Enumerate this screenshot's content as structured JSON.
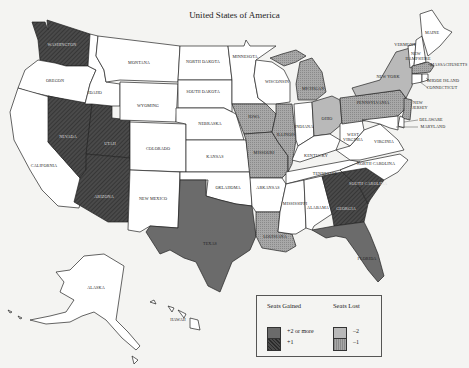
{
  "map": {
    "subtitle": "United States of America",
    "colors": {
      "gain2": "#6b6b6b",
      "gain1": "#3e3e3e",
      "lost2": "#b9b9b9",
      "lost1": "#9c9c9c",
      "none": "#ffffff",
      "border": "#222222"
    },
    "states": [
      {
        "name": "WASHINGTON",
        "category": "+1"
      },
      {
        "name": "OREGON",
        "category": "none"
      },
      {
        "name": "CALIFORNIA",
        "category": "none"
      },
      {
        "name": "NEVADA",
        "category": "+1"
      },
      {
        "name": "UTAH",
        "category": "+1"
      },
      {
        "name": "ARIZONA",
        "category": "+1"
      },
      {
        "name": "IDAHO",
        "category": "none"
      },
      {
        "name": "MONTANA",
        "category": "none"
      },
      {
        "name": "WYOMING",
        "category": "none"
      },
      {
        "name": "COLORADO",
        "category": "none"
      },
      {
        "name": "NEW MEXICO",
        "category": "none"
      },
      {
        "name": "NORTH DAKOTA",
        "category": "none"
      },
      {
        "name": "SOUTH DAKOTA",
        "category": "none"
      },
      {
        "name": "NEBRASKA",
        "category": "none"
      },
      {
        "name": "KANSAS",
        "category": "none"
      },
      {
        "name": "OKLAHOMA",
        "category": "none"
      },
      {
        "name": "TEXAS",
        "category": "+2 or more"
      },
      {
        "name": "MINNESOTA",
        "category": "none"
      },
      {
        "name": "IOWA",
        "category": "-1"
      },
      {
        "name": "MISSOURI",
        "category": "-1"
      },
      {
        "name": "ARKANSAS",
        "category": "none"
      },
      {
        "name": "LOUISIANA",
        "category": "-1"
      },
      {
        "name": "WISCONSIN",
        "category": "none"
      },
      {
        "name": "ILLINOIS",
        "category": "-1"
      },
      {
        "name": "MICHIGAN",
        "category": "-1"
      },
      {
        "name": "INDIANA",
        "category": "none"
      },
      {
        "name": "OHIO",
        "category": "-2"
      },
      {
        "name": "KENTUCKY",
        "category": "none"
      },
      {
        "name": "TENNESSEE",
        "category": "none"
      },
      {
        "name": "MISSISSIPPI",
        "category": "none"
      },
      {
        "name": "ALABAMA",
        "category": "none"
      },
      {
        "name": "GEORGIA",
        "category": "+1"
      },
      {
        "name": "FLORIDA",
        "category": "+2 or more"
      },
      {
        "name": "SOUTH CAROLINA",
        "category": "+1"
      },
      {
        "name": "NORTH CAROLINA",
        "category": "none"
      },
      {
        "name": "VIRGINIA",
        "category": "none"
      },
      {
        "name": "WEST VIRGINIA",
        "category": "none"
      },
      {
        "name": "PENNSYLVANIA",
        "category": "-1"
      },
      {
        "name": "NEW YORK",
        "category": "-2"
      },
      {
        "name": "NEW JERSEY",
        "category": "-1"
      },
      {
        "name": "DELAWARE",
        "category": "none"
      },
      {
        "name": "MARYLAND",
        "category": "none"
      },
      {
        "name": "VERMONT",
        "category": "none"
      },
      {
        "name": "NEW HAMPSHIRE",
        "category": "none"
      },
      {
        "name": "MAINE",
        "category": "none"
      },
      {
        "name": "MASSACHUSETTS",
        "category": "-1"
      },
      {
        "name": "RHODE ISLAND",
        "category": "none"
      },
      {
        "name": "CONNECTICUT",
        "category": "none"
      },
      {
        "name": "ALASKA",
        "category": "none"
      },
      {
        "name": "HAWAII",
        "category": "none"
      }
    ],
    "labels": {
      "wa": "WASHINGTON",
      "or": "OREGON",
      "ca": "CALIFORNIA",
      "nv": "NEVADA",
      "ut": "UTAH",
      "az": "ARIZONA",
      "id": "IDAHO",
      "mt": "MONTANA",
      "wy": "WYOMING",
      "co": "COLORADO",
      "nm": "NEW MEXICO",
      "nd": "NORTH DAKOTA",
      "sd": "SOUTH DAKOTA",
      "ne": "NEBRASKA",
      "ks": "KANSAS",
      "ok": "OKLAHOMA",
      "tx": "TEXAS",
      "mn": "MINNESOTA",
      "ia": "IOWA",
      "mo": "MISSOURI",
      "ar": "ARKANSAS",
      "la": "LOUISIANA",
      "wi": "WISCONSIN",
      "il": "ILLINOIS",
      "mi": "MICHIGAN",
      "in": "INDIANA",
      "oh": "OHIO",
      "ky": "KENTUCKY",
      "tn": "TENNESSEE",
      "ms": "MISSISSIPPI",
      "al": "ALABAMA",
      "ga": "GEORGIA",
      "fl": "FLORIDA",
      "sc": "SOUTH CAROLINA",
      "nc": "NORTH CAROLINA",
      "va": "VIRGINIA",
      "wv1": "WEST",
      "wv2": "VIRGINIA",
      "pa": "PENNSYLVANIA",
      "ny": "NEW YORK",
      "nj1": "NEW",
      "nj2": "JERSEY",
      "de": "DELAWARE",
      "md": "MARYLAND",
      "vt": "VERMONT",
      "nh1": "NEW",
      "nh2": "HAMPSHIRE",
      "me": "MAINE",
      "ma": "MASSACHUSETTS",
      "ri": "RHODE ISLAND",
      "ct": "CONNECTICUT",
      "ak": "ALASKA",
      "hi": "HAWAII"
    }
  },
  "legend": {
    "gained_title": "Seats Gained",
    "lost_title": "Seats Lost",
    "items": [
      {
        "label": "+2 or more",
        "fill": "gain2"
      },
      {
        "label": "+1",
        "fill": "gain1"
      },
      {
        "label": "–2",
        "fill": "lost2"
      },
      {
        "label": "–1",
        "fill": "lost1"
      }
    ]
  }
}
